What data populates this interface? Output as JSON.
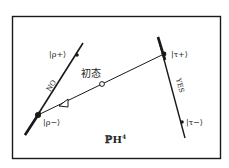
{
  "diagram": {
    "space_label": "ℙH",
    "space_superscript": "4",
    "initial_state_label": "初态",
    "no_line_label": "NO",
    "yes_line_label": "YES",
    "rho_plus_label": "|ρ+⟩",
    "rho_minus_label": "|ρ−⟩",
    "tau_plus_label": "|τ+⟩",
    "tau_minus_label": "|τ−⟩",
    "colors": {
      "ink": "#1a1a1a",
      "background": "#ffffff"
    }
  }
}
